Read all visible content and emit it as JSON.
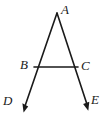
{
  "figure": {
    "type": "geometry-diagram",
    "background_color": "#ffffff",
    "stroke_color": "#1a1a1a",
    "label_color": "#1a1a1a",
    "stroke_width": 1.6,
    "points": {
      "A": {
        "label": "A",
        "x": 57,
        "y": 13,
        "label_x": 61,
        "label_y": 3
      },
      "B": {
        "label": "B",
        "x": 34,
        "y": 67,
        "label_x": 20,
        "label_y": 58
      },
      "C": {
        "label": "C",
        "x": 78,
        "y": 67,
        "label_x": 81,
        "label_y": 59
      },
      "D": {
        "label": "D",
        "x": 24,
        "y": 112,
        "label_x": 3,
        "label_y": 94
      },
      "E": {
        "label": "E",
        "x": 88,
        "y": 110,
        "label_x": 91,
        "label_y": 93
      }
    },
    "segments": [
      {
        "name": "ray-A-to-D",
        "from": "A",
        "to": "D",
        "arrow_at_end": true
      },
      {
        "name": "ray-A-to-E",
        "from": "A",
        "to": "E",
        "arrow_at_end": true
      },
      {
        "name": "segment-B-to-C",
        "from": "B",
        "to": "C",
        "arrow_at_end": false
      }
    ]
  }
}
